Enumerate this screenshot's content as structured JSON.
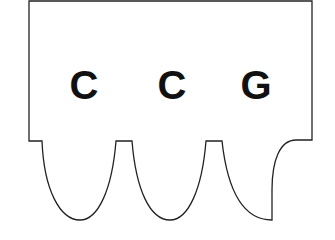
{
  "diagram": {
    "type": "codon-shape",
    "letters": [
      "C",
      "C",
      "G"
    ],
    "stroke_color": "#222222",
    "fill_color": "#ffffff",
    "text_color": "#111111"
  }
}
